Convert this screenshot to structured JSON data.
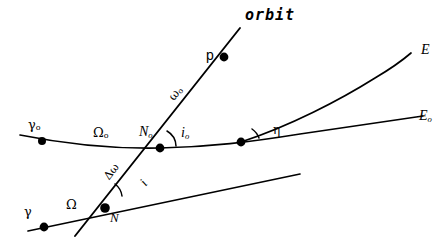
{
  "figure": {
    "type": "orbital-elements-diagram",
    "background_color": "#ffffff",
    "stroke_color": "#000000",
    "width": 444,
    "height": 248
  },
  "labels": {
    "orbit": "orbit",
    "perigee": "p",
    "argument_of_perigee_initial": {
      "base": "ω",
      "sub": "o"
    },
    "inclination_initial": {
      "base": "i",
      "sub": "o"
    },
    "inclination": {
      "base": "i",
      "sub": ""
    },
    "delta_argument_of_perigee": {
      "base": "Δω",
      "sub": ""
    },
    "node_initial": {
      "base": "N",
      "sub": "o"
    },
    "node": {
      "base": "N",
      "sub": ""
    },
    "raan_initial": {
      "base": "Ω",
      "sub": "o"
    },
    "raan": {
      "base": "Ω",
      "sub": ""
    },
    "vernal_equinox_initial": {
      "base": "γ",
      "sub": "o"
    },
    "vernal_equinox": {
      "base": "γ",
      "sub": ""
    },
    "equator": {
      "base": "E",
      "sub": ""
    },
    "equator_initial": {
      "base": "E",
      "sub": "o"
    },
    "eta_angle": {
      "base": "η",
      "sub": ""
    }
  },
  "points": {
    "vernal_equinox_initial": {
      "x": 42,
      "y": 141
    },
    "node_initial": {
      "x": 160,
      "y": 148
    },
    "intersection_equators": {
      "x": 241,
      "y": 142
    },
    "perigee": {
      "x": 224,
      "y": 57
    },
    "vernal_equinox": {
      "x": 44,
      "y": 227
    },
    "node": {
      "x": 105,
      "y": 208
    }
  },
  "curves": {
    "equator_initial_path": "M 20,135 C 60,143 110,149 160,148 C 210,147 250,142 300,134 C 350,127 395,120 423,116",
    "equator_path": "M 241,142 C 290,126 340,100 375,78 C 392,68 404,59 411,53",
    "orbit_path": "M 240,28 L 75,236",
    "node_line_path": "M 28,231 L 300,174"
  },
  "angle_arcs": {
    "i_zero": "M 176,146 A 18,18 0 0 0 167,131",
    "i_lower": "M 122,196 A 18,18 0 0 0 115,184",
    "eta": "M 259,138 A 19,19 0 0 0 252,129"
  }
}
